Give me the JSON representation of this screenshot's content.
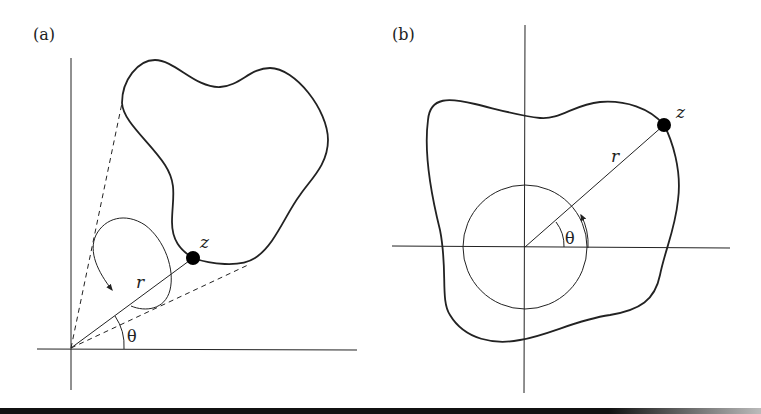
{
  "figure": {
    "panels": [
      {
        "label": "(a)",
        "point_label": "z",
        "radius_label": "r",
        "angle_label": "θ",
        "description": "Origin outside a closed curve; point z on curve; winding arrow loop near origin"
      },
      {
        "label": "(b)",
        "point_label": "z",
        "radius_label": "r",
        "angle_label": "θ",
        "description": "Origin inside a closed curve; unit circle around origin; point z on curve"
      }
    ],
    "colors": {
      "stroke": "#222222",
      "background": "#ffffff",
      "point": "#000000"
    }
  }
}
